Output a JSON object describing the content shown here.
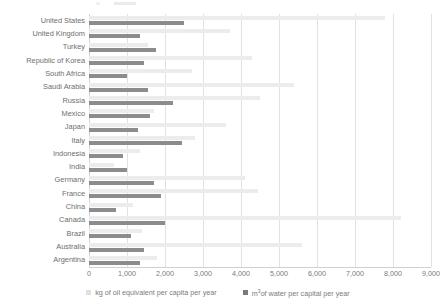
{
  "chart_data": {
    "type": "bar",
    "orientation": "horizontal",
    "title": "",
    "xlabel": "",
    "ylabel": "",
    "xlim": [
      0,
      9000
    ],
    "xticks": [
      "0",
      "1,000",
      "2,000",
      "3,000",
      "4,000",
      "5,000",
      "6,000",
      "7,000",
      "8,000",
      "9,000"
    ],
    "xtick_values": [
      0,
      1000,
      2000,
      3000,
      4000,
      5000,
      6000,
      7000,
      8000,
      9000
    ],
    "grid": true,
    "grid_axis": "x",
    "legend_position": "bottom",
    "categories": [
      "United States",
      "United Kingdom",
      "Turkey",
      "Republic of Korea",
      "South Africa",
      "Saudi Arabia",
      "Russia",
      "Mexico",
      "Japan",
      "Italy",
      "Indonesia",
      "India",
      "Germany",
      "France",
      "China",
      "Canada",
      "Brazil",
      "Australia",
      "Argentina"
    ],
    "series": [
      {
        "name": "kg of oil equivalent per capita per year",
        "color": "#ececec",
        "values": [
          7800,
          3700,
          1550,
          4300,
          2700,
          5400,
          4500,
          1700,
          3600,
          2800,
          1350,
          650,
          4100,
          4450,
          1150,
          8200,
          1400,
          5600,
          1800
        ]
      },
      {
        "name": "m³ of water per capital per year",
        "color": "#8c8c8c",
        "values": [
          2500,
          1350,
          1750,
          1450,
          1000,
          1550,
          2200,
          1600,
          1300,
          2450,
          900,
          1000,
          1700,
          1900,
          700,
          2000,
          1100,
          1450,
          1350
        ]
      }
    ]
  },
  "legend": {
    "items": [
      {
        "label": "kg of oil equivalent per capita per year",
        "swatch": "oil"
      },
      {
        "label_prefix": "m",
        "label_sup": "3",
        "label_suffix": "of water per capital per year",
        "swatch": "water"
      }
    ]
  },
  "colors": {
    "oil_bar": "#ececec",
    "water_bar": "#8c8c8c",
    "gridline": "#e2e2e2",
    "axis": "#d0d0d0",
    "text": "#7b7b7b"
  }
}
